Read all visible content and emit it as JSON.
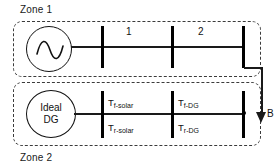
{
  "diagram": {
    "zones": [
      {
        "id": "zone1",
        "label": "Zone 1"
      },
      {
        "id": "zone2",
        "label": "Zone 2"
      }
    ],
    "sources": {
      "ac_source": {
        "icon": "ac-sine-source-icon",
        "label": ""
      },
      "ideal_dg": {
        "line1": "Ideal",
        "line2": "DG"
      }
    },
    "line_sections": [
      {
        "id": "section-1",
        "label": "1"
      },
      {
        "id": "section-2",
        "label": "2"
      }
    ],
    "relay_labels": [
      {
        "id": "t-f-solar",
        "symbol": "T",
        "subscript": "f-solar"
      },
      {
        "id": "t-r-solar",
        "symbol": "T",
        "subscript": "r-solar"
      },
      {
        "id": "t-f-dg",
        "symbol": "T",
        "subscript": "f-DG"
      },
      {
        "id": "t-r-dg",
        "symbol": "T",
        "subscript": "r-DG"
      }
    ],
    "flow_arrow": {
      "label": "B",
      "direction": "down",
      "icon": "down-arrow-icon"
    },
    "colors": {
      "line": "#1a1a1a",
      "busbar": "#000000",
      "zone_border": "#3b3b3b",
      "background": "#ffffff",
      "text": "#111111"
    }
  }
}
